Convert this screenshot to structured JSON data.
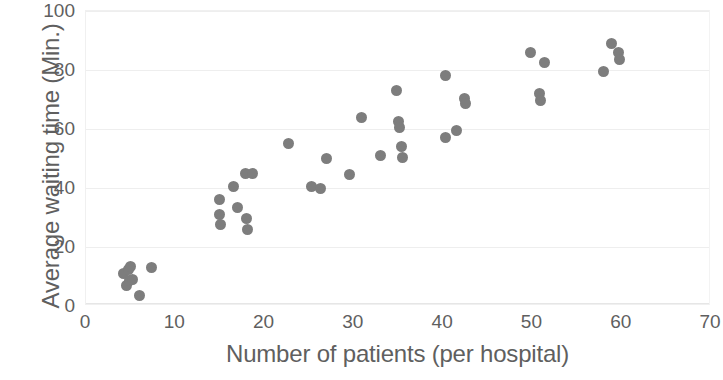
{
  "chart_data": {
    "type": "scatter",
    "title": "",
    "xlabel": "Number of patients (per hospital)",
    "ylabel": "Average waiting time (Min.)",
    "xlim": [
      0,
      70
    ],
    "ylim": [
      0,
      100
    ],
    "xticks": [
      0,
      10,
      20,
      30,
      40,
      50,
      60,
      70
    ],
    "yticks": [
      0,
      20,
      40,
      60,
      80,
      100
    ],
    "grid": true,
    "legend": false,
    "point_color": "#7d7d7d",
    "point_size": 11,
    "series": [
      {
        "name": "Hospitals",
        "points": [
          [
            4.2,
            11.0
          ],
          [
            4.8,
            12.5
          ],
          [
            5.0,
            13.5
          ],
          [
            4.5,
            7.0
          ],
          [
            4.9,
            8.5
          ],
          [
            5.2,
            9.0
          ],
          [
            6.0,
            3.5
          ],
          [
            7.3,
            13.0
          ],
          [
            15.0,
            36.0
          ],
          [
            15.0,
            31.0
          ],
          [
            15.1,
            27.5
          ],
          [
            16.5,
            40.5
          ],
          [
            17.0,
            33.5
          ],
          [
            17.9,
            45.0
          ],
          [
            18.6,
            45.0
          ],
          [
            18.0,
            29.5
          ],
          [
            18.1,
            26.0
          ],
          [
            22.7,
            55.0
          ],
          [
            25.2,
            40.5
          ],
          [
            26.3,
            40.0
          ],
          [
            26.9,
            50.0
          ],
          [
            29.5,
            44.5
          ],
          [
            30.8,
            64.0
          ],
          [
            33.0,
            51.0
          ],
          [
            34.8,
            73.0
          ],
          [
            35.0,
            62.5
          ],
          [
            35.1,
            60.5
          ],
          [
            35.3,
            54.0
          ],
          [
            35.4,
            50.5
          ],
          [
            40.3,
            78.0
          ],
          [
            40.3,
            57.0
          ],
          [
            41.5,
            59.5
          ],
          [
            42.4,
            70.5
          ],
          [
            42.5,
            68.5
          ],
          [
            49.8,
            86.0
          ],
          [
            51.3,
            82.5
          ],
          [
            50.8,
            72.0
          ],
          [
            50.9,
            69.5
          ],
          [
            58.0,
            79.5
          ],
          [
            58.9,
            89.0
          ],
          [
            59.6,
            86.0
          ],
          [
            59.7,
            83.5
          ]
        ]
      }
    ]
  },
  "axes": {
    "x_tick_labels": [
      "0",
      "10",
      "20",
      "30",
      "40",
      "50",
      "60",
      "70"
    ],
    "y_tick_labels": [
      "0",
      "20",
      "40",
      "60",
      "80",
      "100"
    ]
  }
}
